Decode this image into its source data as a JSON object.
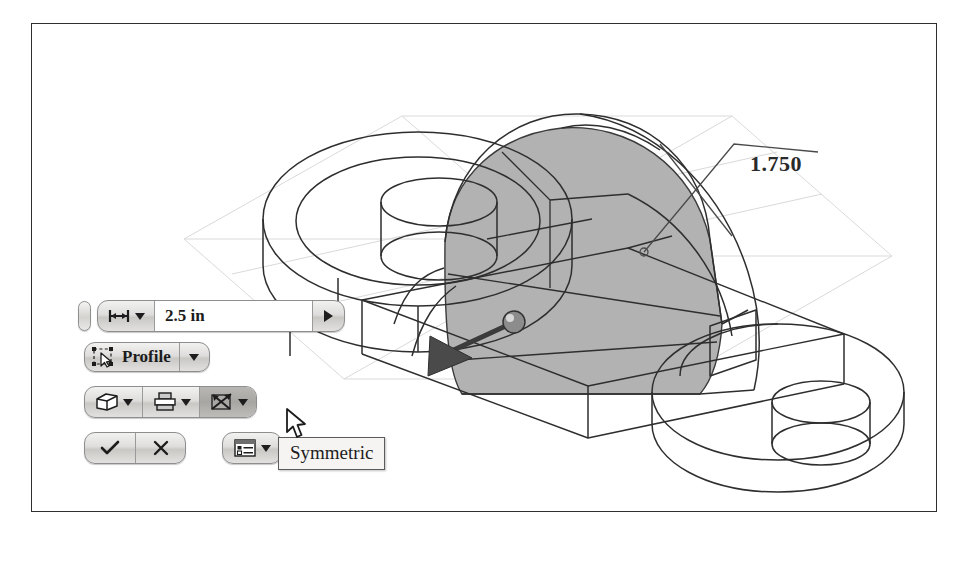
{
  "app": {
    "context": "3d-cad-extrude-mini-toolbar"
  },
  "viewport": {
    "dimension_label": "1.750",
    "shaded_face_color": "#b2b2b2",
    "edge_color": "#303030",
    "construction_plane_color": "#d8d8d8",
    "background": "#ffffff"
  },
  "toolbar": {
    "drag_handle": "drag-handle",
    "value_row": {
      "measure_icon": "extent-distance-icon",
      "measure_caret": "chevron-down-icon",
      "value": "2.5 in",
      "placeholder": "2.5 in",
      "stepper_icon": "chevron-right-icon"
    },
    "profile_row": {
      "icon": "select-profile-icon",
      "label": "Profile",
      "caret": "chevron-down-icon"
    },
    "ops_row": {
      "buttons": [
        {
          "icon": "solid-cube-icon",
          "caret": "chevron-down-icon",
          "active": false,
          "name": "solid-output"
        },
        {
          "icon": "boolean-join-icon",
          "caret": "chevron-down-icon",
          "active": false,
          "name": "boolean-operation"
        },
        {
          "icon": "symmetric-direction-icon",
          "caret": "chevron-down-icon",
          "active": true,
          "name": "direction-symmetric"
        }
      ]
    },
    "confirm_row": {
      "ok_icon": "checkmark-icon",
      "cancel_icon": "close-x-icon",
      "options_icon": "more-options-list-icon",
      "options_caret": "chevron-down-icon"
    }
  },
  "tooltip": {
    "text": "Symmetric",
    "visible": true
  },
  "cursor": {
    "icon": "mouse-pointer-icon"
  }
}
